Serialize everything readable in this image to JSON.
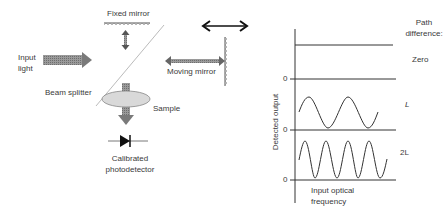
{
  "interferometer": {
    "fixed_mirror": "Fixed mirror",
    "input_light_1": "Input",
    "input_light_2": "light",
    "beam_splitter": "Beam splitter",
    "moving_mirror": "Moving mirror",
    "sample": "Sample",
    "detector_1": "Calibrated",
    "detector_2": "photodetector"
  },
  "plot": {
    "legend_title_1": "Path",
    "legend_title_2": "difference:",
    "ylabel": "Detected output",
    "xlabel_1": "Input optical",
    "xlabel_2": "frequency",
    "traces": [
      {
        "path_difference": "Zero",
        "zero_tick": "0"
      },
      {
        "path_difference": "L",
        "zero_tick": "0"
      },
      {
        "path_difference": "2L",
        "zero_tick": "0"
      }
    ]
  },
  "colors": {
    "line": "#333333",
    "arrow_fill": "#8a8a8a",
    "sample_fill": "#d9d9d9"
  }
}
